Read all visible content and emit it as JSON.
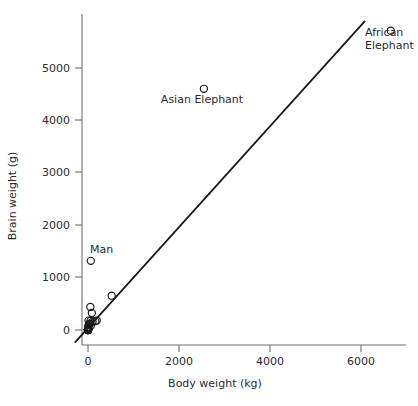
{
  "chart_data": {
    "type": "scatter",
    "title": "",
    "xlabel": "Body weight (kg)",
    "ylabel": "Brain weight (g)",
    "xlim": [
      -320,
      7050
    ],
    "ylim": [
      -290,
      6050
    ],
    "xticks": [
      0,
      2000,
      4000,
      6000
    ],
    "yticks": [
      0,
      1000,
      2000,
      3000,
      4000,
      5000
    ],
    "xticklabels": [
      "0",
      "2000",
      "4000",
      "6000"
    ],
    "yticklabels": [
      "0",
      "1000",
      "2000",
      "3000",
      "4000",
      "5000"
    ],
    "grid": false,
    "legend": null,
    "marker_style": "open-circle",
    "x": [
      6654,
      2547,
      62.0,
      1.0,
      0.023,
      0.12,
      2.5,
      55.5,
      100.0,
      52.16,
      10.55,
      0.55,
      60.0,
      3.6,
      4.288,
      0.28,
      0.075,
      0.122,
      0.101,
      521.0,
      85.0,
      36.33,
      27.66,
      14.83,
      1.04,
      4.19,
      0.425,
      0.101,
      0.92,
      1.0,
      0.005,
      0.06,
      3.5,
      2.0,
      1.7,
      192.0,
      3.0,
      160.0,
      0.9,
      1.62,
      0.104,
      4.235
    ],
    "y": [
      5712,
      4603,
      1320,
      6.6,
      0.4,
      1.0,
      12.1,
      175,
      157,
      440,
      179.5,
      2.4,
      81,
      21,
      39.2,
      1.9,
      1.2,
      3.0,
      4.0,
      655,
      325,
      119.5,
      115,
      98.2,
      5.5,
      58,
      6.4,
      4.0,
      5.7,
      6.6,
      0.14,
      1.0,
      10.8,
      12.3,
      6.3,
      180,
      25,
      169,
      2.6,
      11.4,
      2.5,
      50.4
    ],
    "annotations": [
      {
        "label": "African Elephant",
        "point_x": 6654,
        "point_y": 5712,
        "label_lines": [
          "African",
          "Elephant"
        ]
      },
      {
        "label": "Asian Elephant",
        "point_x": 2547,
        "point_y": 4603,
        "label_lines": [
          "Asian Elephant"
        ]
      },
      {
        "label": "Man",
        "point_x": 62.0,
        "point_y": 1320,
        "label_lines": [
          "Man"
        ]
      }
    ],
    "fit_line": {
      "type": "linear-regression",
      "x_start": -280,
      "y_start": -230,
      "x_end": 6080,
      "y_end": 5890
    },
    "colors": {
      "marker_stroke": "#1a1a1a",
      "fit_line": "#1a1a1a",
      "axis": "#6e6e6e",
      "text": "#2b2b2b",
      "background": "#ffffff"
    }
  },
  "labels": {
    "african_elephant_line1": "African",
    "african_elephant_line2": "Elephant",
    "asian_elephant": "Asian Elephant",
    "man": "Man"
  }
}
